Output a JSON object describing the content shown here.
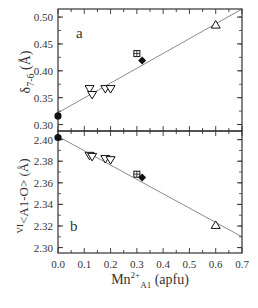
{
  "chart_data": [
    {
      "type": "scatter",
      "panel_label": "a",
      "title": "",
      "xlabel": "Mn2+A1 (apfu)",
      "ylabel": "δ7-6 (Å)",
      "xlim": [
        0.0,
        0.7
      ],
      "ylim": [
        0.288,
        0.515
      ],
      "yticks": [
        0.3,
        0.35,
        0.4,
        0.45,
        0.5
      ],
      "ytick_labels": [
        "0.30",
        "0.35",
        "0.40",
        "0.45",
        "0.50"
      ],
      "grid": false,
      "legend": "none",
      "series": [
        {
          "name": "filled-circle",
          "marker": "circle-filled",
          "x": [
            0.0
          ],
          "y": [
            0.316
          ]
        },
        {
          "name": "open-down-triangle",
          "marker": "triangle-down-open",
          "x": [
            0.12,
            0.13,
            0.18,
            0.2
          ],
          "y": [
            0.366,
            0.355,
            0.366,
            0.366
          ]
        },
        {
          "name": "boxed-plus",
          "marker": "square-plus-open",
          "x": [
            0.3
          ],
          "y": [
            0.432
          ]
        },
        {
          "name": "filled-diamond",
          "marker": "diamond-filled",
          "x": [
            0.32
          ],
          "y": [
            0.419
          ]
        },
        {
          "name": "open-up-triangle",
          "marker": "triangle-up-open",
          "x": [
            0.6
          ],
          "y": [
            0.486
          ]
        }
      ],
      "fit_line": {
        "x": [
          0.0,
          0.7
        ],
        "y": [
          0.322,
          0.515
        ]
      }
    },
    {
      "type": "scatter",
      "panel_label": "b",
      "title": "",
      "xlabel": "Mn2+A1 (apfu)",
      "ylabel": "VI<A1-O> (Å)",
      "xlim": [
        0.0,
        0.7
      ],
      "ylim": [
        2.295,
        2.408
      ],
      "xticks": [
        0.0,
        0.1,
        0.2,
        0.3,
        0.4,
        0.5,
        0.6,
        0.7
      ],
      "xtick_labels": [
        "0.0",
        "0.1",
        "0.2",
        "0.3",
        "0.4",
        "0.5",
        "0.6",
        "0.7"
      ],
      "yticks": [
        2.3,
        2.32,
        2.34,
        2.36,
        2.38,
        2.4
      ],
      "ytick_labels": [
        "2.30",
        "2.32",
        "2.34",
        "2.36",
        "2.38",
        "2.40"
      ],
      "grid": false,
      "legend": "none",
      "series": [
        {
          "name": "filled-circle",
          "marker": "circle-filled",
          "x": [
            0.0
          ],
          "y": [
            2.402
          ]
        },
        {
          "name": "open-down-triangle",
          "marker": "triangle-down-open",
          "x": [
            0.12,
            0.13,
            0.18,
            0.2
          ],
          "y": [
            2.385,
            2.384,
            2.382,
            2.381
          ]
        },
        {
          "name": "boxed-plus",
          "marker": "square-plus-open",
          "x": [
            0.3
          ],
          "y": [
            2.368
          ]
        },
        {
          "name": "filled-diamond",
          "marker": "diamond-filled",
          "x": [
            0.32
          ],
          "y": [
            2.365
          ]
        },
        {
          "name": "open-up-triangle",
          "marker": "triangle-up-open",
          "x": [
            0.6
          ],
          "y": [
            2.321
          ]
        }
      ],
      "fit_line": {
        "x": [
          0.0,
          0.7
        ],
        "y": [
          2.403,
          2.31
        ]
      }
    }
  ],
  "labels": {
    "panel_a": "a",
    "panel_b": "b",
    "ylabel_a_main": "δ",
    "ylabel_a_sub": "7-6",
    "ylabel_a_unit": " (Å)",
    "ylabel_b_sup": "VI",
    "ylabel_b_main": "<A1-O>",
    "ylabel_b_unit": " (Å)",
    "xlabel_main": "Mn",
    "xlabel_sup": "2+",
    "xlabel_sub": "A1",
    "xlabel_unit": " (apfu)"
  },
  "colors": {
    "axis": "#333333",
    "fit_line": "#8a8a8a",
    "marker": "#111111",
    "background": "#ffffff"
  }
}
